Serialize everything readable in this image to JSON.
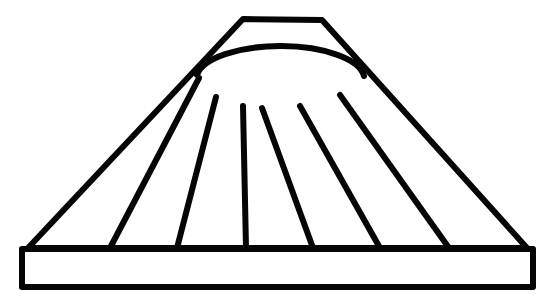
{
  "image": {
    "title": "Pleated fan shade line drawing",
    "kind": "line-art",
    "description": "Black outline drawing of a trapezoidal pleated fan shade sitting on a rectangular base bar",
    "width": 559,
    "height": 305,
    "background_color": "#ffffff",
    "stroke_color": "#050505",
    "stroke_width": 6
  },
  "geometry": {
    "base_bar": {
      "name": "base-bar",
      "x": 22,
      "y": 249,
      "width": 511,
      "height": 38,
      "left": 22,
      "right": 533,
      "top": 249,
      "bottom": 287
    },
    "trapezoid": {
      "name": "trapezoid-body",
      "top_left": [
        243,
        19
      ],
      "top_right": [
        322,
        20
      ],
      "bottom_left": [
        28,
        248
      ],
      "bottom_right": [
        527,
        248
      ]
    },
    "hub_arc": {
      "name": "hub-arc",
      "start": [
        197,
        75
      ],
      "end": [
        364,
        76
      ],
      "rx": 84,
      "ry": 33,
      "sweep": 1,
      "bottom_center_y": 107
    },
    "ribs": [
      {
        "name": "rib-1",
        "top": [
          199,
          78
        ],
        "bottom": [
          110,
          248
        ]
      },
      {
        "name": "rib-2",
        "top": [
          216,
          97
        ],
        "bottom": [
          177,
          248
        ]
      },
      {
        "name": "rib-3",
        "top": [
          243,
          106
        ],
        "bottom": [
          246,
          248
        ]
      },
      {
        "name": "rib-4",
        "top": [
          262,
          108
        ],
        "bottom": [
          313,
          248
        ]
      },
      {
        "name": "rib-5",
        "top": [
          300,
          106
        ],
        "bottom": [
          380,
          248
        ]
      },
      {
        "name": "rib-6",
        "top": [
          340,
          95
        ],
        "bottom": [
          449,
          248
        ]
      }
    ],
    "panels": [
      {
        "name": "panel-left-outer"
      },
      {
        "name": "panel-left-mid"
      },
      {
        "name": "panel-left-inner"
      },
      {
        "name": "panel-center"
      },
      {
        "name": "panel-right-inner"
      },
      {
        "name": "panel-right-mid"
      },
      {
        "name": "panel-right-outer"
      }
    ],
    "counts": {
      "ribs": 6,
      "panels": 7
    }
  },
  "labels": {
    "figure_caption": "",
    "annotations": []
  }
}
